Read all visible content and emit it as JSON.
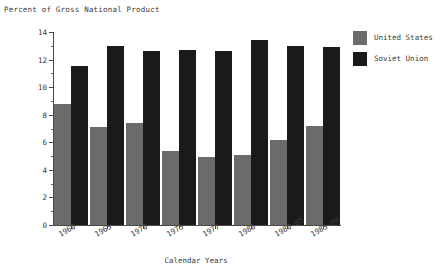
{
  "chart_data": {
    "type": "bar",
    "title": "Percent of Gross National Product",
    "xlabel": "Calendar Years",
    "ylabel": "",
    "ylim": [
      0,
      14
    ],
    "ytick_step": 2,
    "yticks": [
      0,
      2,
      4,
      6,
      8,
      10,
      12,
      14
    ],
    "yticks_minor": [
      1,
      3,
      5,
      7,
      9,
      11,
      13
    ],
    "grid": false,
    "legend_position": "right",
    "categories": [
      "1960",
      "1965",
      "1970",
      "1975",
      "1977",
      "1980",
      "1980-85",
      "1985-90"
    ],
    "series": [
      {
        "name": "United States",
        "color": "#6b6b6b",
        "values": [
          8.8,
          7.1,
          7.4,
          5.4,
          4.9,
          5.1,
          6.2,
          7.2
        ]
      },
      {
        "name": "Soviet Union",
        "color": "#1a1a1a",
        "values": [
          11.5,
          13.0,
          12.6,
          12.7,
          12.6,
          13.4,
          13.0,
          12.9
        ]
      }
    ]
  },
  "legend": {
    "items": [
      {
        "label": "United States",
        "color": "#6b6b6b"
      },
      {
        "label": "Soviet Union",
        "color": "#1a1a1a"
      }
    ]
  }
}
